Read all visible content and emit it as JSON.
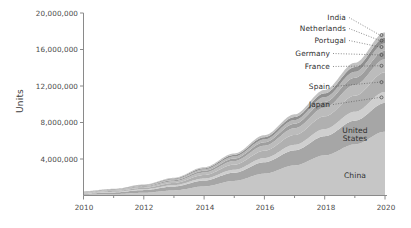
{
  "chart_data": {
    "type": "area",
    "stacked": true,
    "title": "",
    "xlabel": "",
    "ylabel": "Units",
    "x": [
      2010,
      2011,
      2012,
      2013,
      2014,
      2015,
      2016,
      2017,
      2018,
      2019,
      2020
    ],
    "xlim": [
      2010,
      2020
    ],
    "ylim": [
      0,
      20000000
    ],
    "xticks": [
      "2010",
      "2012",
      "2014",
      "2016",
      "2018",
      "2020"
    ],
    "xticks_minor": [
      "2011",
      "2013",
      "2015",
      "2017",
      "2019"
    ],
    "yticks": [
      "4,000,000",
      "8,000,000",
      "12,000,000",
      "16,000,000",
      "20,000,000"
    ],
    "ytick_values": [
      4000000,
      8000000,
      12000000,
      16000000,
      20000000
    ],
    "grid": false,
    "legend_position": "inline-labels",
    "series": [
      {
        "name": "China",
        "label_kind": "inline",
        "color": "#c6c6c6",
        "values": [
          90000,
          160000,
          300000,
          560000,
          1000000,
          1600000,
          2400000,
          3300000,
          4400000,
          5600000,
          7000000
        ]
      },
      {
        "name": "United States",
        "label_kind": "inline",
        "color": "#a6a6a6",
        "values": [
          120000,
          180000,
          290000,
          430000,
          640000,
          900000,
          1250000,
          1650000,
          2100000,
          2600000,
          3150000
        ]
      },
      {
        "name": "Japan",
        "label_kind": "leader",
        "color": "#cfcfcf",
        "values": [
          40000,
          60000,
          95000,
          145000,
          220000,
          320000,
          450000,
          600000,
          780000,
          980000,
          1200000
        ]
      },
      {
        "name": "Spain",
        "label_kind": "leader",
        "color": "#b0b0b0",
        "values": [
          60000,
          95000,
          150000,
          240000,
          380000,
          560000,
          800000,
          1080000,
          1400000,
          1760000,
          2150000
        ]
      },
      {
        "name": "France",
        "label_kind": "leader",
        "color": "#bcbcbc",
        "values": [
          50000,
          75000,
          120000,
          185000,
          280000,
          400000,
          560000,
          740000,
          950000,
          1180000,
          1430000
        ]
      },
      {
        "name": "Germany",
        "label_kind": "leader",
        "color": "#9e9e9e",
        "values": [
          35000,
          52000,
          80000,
          122000,
          185000,
          265000,
          370000,
          490000,
          625000,
          780000,
          950000
        ]
      },
      {
        "name": "Portugal",
        "label_kind": "leader",
        "color": "#b6b6b6",
        "values": [
          30000,
          45000,
          70000,
          105000,
          158000,
          225000,
          310000,
          410000,
          525000,
          650000,
          790000
        ]
      },
      {
        "name": "Netherlands",
        "label_kind": "leader",
        "color": "#8f8f8f",
        "values": [
          25000,
          37000,
          57000,
          86000,
          128000,
          182000,
          250000,
          330000,
          420000,
          520000,
          630000
        ]
      },
      {
        "name": "India",
        "label_kind": "leader",
        "color": "#c2c2c2",
        "values": [
          20000,
          30000,
          47000,
          72000,
          110000,
          158000,
          220000,
          292000,
          375000,
          468000,
          570000
        ]
      }
    ]
  },
  "labels": {
    "india": "India",
    "netherlands": "Netherlands",
    "portugal": "Portugal",
    "germany": "Germany",
    "france": "France",
    "spain": "Spain",
    "japan": "Japan",
    "united_states_line1": "United",
    "united_states_line2": "States",
    "china": "China",
    "units": "Units"
  },
  "axis": {
    "y_ticks": [
      "20,000,000",
      "16,000,000",
      "12,000,000",
      "8,000,000",
      "4,000,000"
    ],
    "x_ticks": [
      "2010",
      "2012",
      "2014",
      "2016",
      "2018",
      "2020"
    ]
  },
  "colors": {
    "axis": "#8a8a8a",
    "text": "#3d3d3d",
    "plot_background": "#ffffff"
  }
}
